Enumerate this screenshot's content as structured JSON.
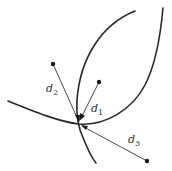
{
  "diagram": {
    "type": "geometry-distance-to-curves",
    "colors": {
      "stroke": "#2a2a2a",
      "background": "#ffffff"
    },
    "intersection": {
      "x": 79,
      "y": 124
    },
    "curves": [
      {
        "name": "curve-a",
        "path": "M135,11 C100,25 80,60 77,100 C76,115 79,130 84,140 C88,150 92,158 96,163"
      },
      {
        "name": "curve-b",
        "path": "M8,101 C35,112 60,122 79,124 C105,126 132,110 145,85 C157,62 161,30 163,8"
      }
    ],
    "segments": [
      {
        "label_base": "d",
        "label_sub": "2",
        "from": {
          "x": 53,
          "y": 64
        },
        "to": {
          "x": 79,
          "y": 122
        },
        "label_pos": {
          "x": 46,
          "y": 92
        }
      },
      {
        "label_base": "d",
        "label_sub": "1",
        "from": {
          "x": 99,
          "y": 82
        },
        "to": {
          "x": 80,
          "y": 120
        },
        "label_pos": {
          "x": 91,
          "y": 112
        }
      },
      {
        "label_base": "d",
        "label_sub": "3",
        "from": {
          "x": 147,
          "y": 161
        },
        "to": {
          "x": 82,
          "y": 126
        },
        "label_pos": {
          "x": 128,
          "y": 143
        }
      }
    ],
    "labels": {
      "d1": {
        "base": "d",
        "sub": "1"
      },
      "d2": {
        "base": "d",
        "sub": "2"
      },
      "d3": {
        "base": "d",
        "sub": "3"
      }
    }
  }
}
